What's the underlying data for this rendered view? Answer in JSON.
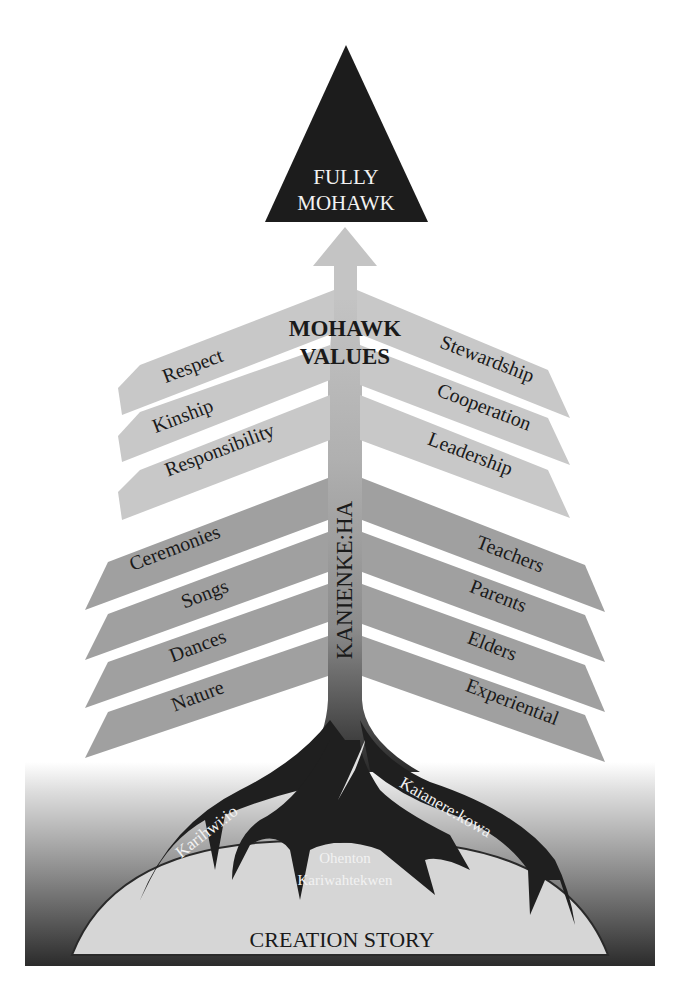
{
  "diagram": {
    "apex": {
      "line1": "FULLY",
      "line2": "MOHAWK"
    },
    "values_heading": {
      "line1": "MOHAWK",
      "line2": "VALUES"
    },
    "trunk_label": "KANIENKE:HA",
    "values_left": [
      "Respect",
      "Kinship",
      "Responsibility"
    ],
    "values_right": [
      "Stewardship",
      "Cooperation",
      "Leadership"
    ],
    "practices_left": [
      "Ceremonies",
      "Songs",
      "Dances",
      "Nature"
    ],
    "practices_right": [
      "Teachers",
      "Parents",
      "Elders",
      "Experiential"
    ],
    "roots": {
      "left": "Karihwi:io",
      "center_line1": "Ohenton",
      "center_line2": "Kariwahtekwen",
      "right": "Kaianere:kowa"
    },
    "foundation": "CREATION STORY"
  },
  "colors": {
    "apex": "#1c1c1c",
    "arrow": "#c4c4c4",
    "values_branch": "#c8c8c8",
    "practices_branch": "#a0a0a0",
    "roots": "#1f1f1f",
    "mound": "#d6d6d6",
    "ground_dark": "#2b2b2b"
  }
}
